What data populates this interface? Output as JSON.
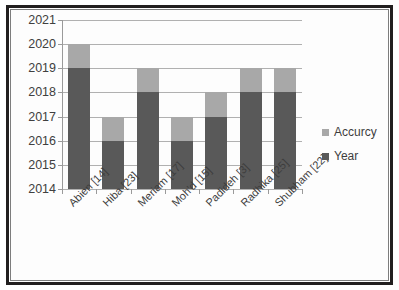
{
  "chart_data": {
    "type": "bar",
    "stacked": true,
    "title": "",
    "xlabel": "",
    "ylabel": "",
    "categories": [
      "Abien [14]",
      "Hiba [23]",
      "Meriam [17]",
      "Moh'd [15]",
      "Padideh [3]",
      "Radhika [25]",
      "Shubham [22]"
    ],
    "series": [
      {
        "name": "Year",
        "color": "#595959",
        "values": [
          2019,
          2016,
          2018,
          2016,
          2017,
          2018,
          2018
        ]
      },
      {
        "name": "Accurcy",
        "color": "#a8a8a8",
        "values": [
          2020,
          2017,
          2019,
          2017,
          2018,
          2019,
          2019
        ]
      }
    ],
    "ylim": [
      2014,
      2021
    ],
    "yticks": [
      2021,
      2020,
      2019,
      2018,
      2017,
      2016,
      2015,
      2014
    ],
    "ytick_labels": [
      "2021",
      "2020",
      "2019",
      "2018",
      "2017",
      "2016",
      "2015",
      "2014"
    ],
    "grid": true,
    "legend_position": "right",
    "legend": [
      {
        "label": "Accurcy",
        "color": "#a8a8a8"
      },
      {
        "label": "Year",
        "color": "#595959"
      }
    ]
  }
}
